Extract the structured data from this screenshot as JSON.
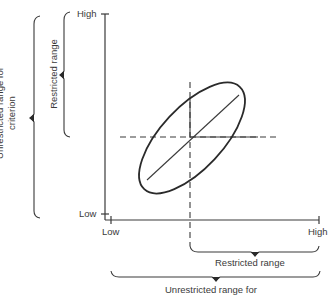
{
  "diagram": {
    "type": "restriction-of-range scatter diagram",
    "y_axis": {
      "high_label": "High",
      "low_label": "Low"
    },
    "x_axis": {
      "low_label": "Low",
      "high_label": "High"
    },
    "left_braces": {
      "inner_label": "Restricted range",
      "outer_label_line1": "Unrestricted range for",
      "outer_label_line2": "criterion"
    },
    "bottom_braces": {
      "inner_label": "Restricted range",
      "outer_label": "Unrestricted range for"
    },
    "colors": {
      "line": "#3a3a3a",
      "background": "#ffffff"
    }
  }
}
